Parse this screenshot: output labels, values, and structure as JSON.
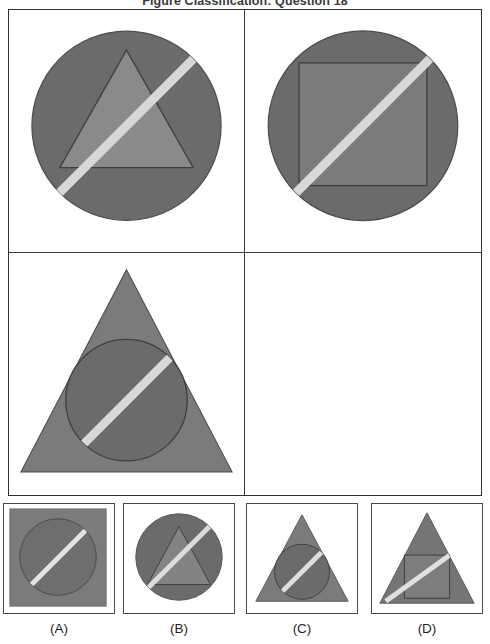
{
  "title": "Figure Classification: Question 18",
  "colors": {
    "outline": "#3a3a3a",
    "frame_border": "#4a4a4a",
    "shape_dark": "#6b6b6b",
    "shape_mid": "#7b7b7b",
    "shape_light": "#8a8a8a",
    "stripe": "#d8d8d8",
    "background": "#ffffff"
  },
  "matrix": {
    "rows": 2,
    "columns": 2,
    "cells": [
      {
        "position": "row1-col1",
        "outer_shape": "circle",
        "inner_shape": "triangle",
        "stripe": "diagonal-bottom-left-to-top-right",
        "stripe_extent": "full-outer-shape",
        "empty": false,
        "description": "Circle containing a triangle with a light diagonal stripe"
      },
      {
        "position": "row1-col2",
        "outer_shape": "circle",
        "inner_shape": "square",
        "stripe": "diagonal-bottom-left-to-top-right",
        "stripe_extent": "full-outer-shape",
        "empty": false,
        "description": "Circle containing a square with a light diagonal stripe"
      },
      {
        "position": "row2-col1",
        "outer_shape": "triangle",
        "inner_shape": "circle",
        "stripe": "diagonal-bottom-left-to-top-right",
        "stripe_extent": "inner-shape-only",
        "empty": false,
        "description": "Triangle containing a circle with a light diagonal stripe inside the circle"
      },
      {
        "position": "row2-col2",
        "outer_shape": "",
        "inner_shape": "",
        "stripe": "",
        "stripe_extent": "",
        "empty": true,
        "description": "Empty cell - the missing figure"
      }
    ]
  },
  "options": [
    {
      "id": "A",
      "label": "(A)",
      "outer_shape": "square",
      "inner_shape": "circle",
      "stripe": "diagonal-bottom-left-to-top-right",
      "stripe_extent": "inner-shape-only",
      "description": "Filled square containing a circle with a light diagonal stripe"
    },
    {
      "id": "B",
      "label": "(B)",
      "outer_shape": "circle",
      "inner_shape": "triangle",
      "stripe": "diagonal-bottom-left-to-top-right",
      "stripe_extent": "full-outer-shape",
      "description": "Circle containing a triangle with a light diagonal stripe"
    },
    {
      "id": "C",
      "label": "(C)",
      "outer_shape": "triangle",
      "inner_shape": "circle",
      "stripe": "diagonal-bottom-left-to-top-right",
      "stripe_extent": "inner-shape-only",
      "description": "Triangle containing a circle with a light diagonal stripe inside the circle"
    },
    {
      "id": "D",
      "label": "(D)",
      "outer_shape": "triangle",
      "inner_shape": "square",
      "stripe": "diagonal-bottom-left-to-top-right",
      "stripe_extent": "full-outer-shape",
      "description": "Triangle containing a square with a long light diagonal stripe"
    }
  ]
}
